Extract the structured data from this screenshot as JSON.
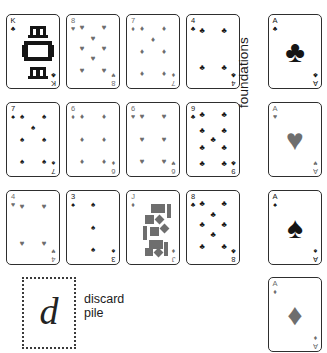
{
  "app": {
    "title": "Solitaire board",
    "background": "#ffffff",
    "black_suit_color": "#151515",
    "red_suit_color": "#6e6e6e"
  },
  "labels": {
    "foundations": "foundations",
    "discard_line1": "discard",
    "discard_line2": "pile",
    "discard_placeholder_glyph": "d"
  },
  "suit_glyphs": {
    "clubs": "♣",
    "hearts": "♥",
    "spades": "♠",
    "diamonds": "♦"
  },
  "tableau": {
    "columns": 4,
    "rows": 3,
    "cards": [
      {
        "rank": "K",
        "suit": "clubs",
        "suit_glyph": "♣",
        "color": "#151515",
        "row": 1,
        "col": 1,
        "face": true
      },
      {
        "rank": "8",
        "suit": "hearts",
        "suit_glyph": "♥",
        "color": "#6e6e6e",
        "row": 1,
        "col": 2,
        "face": false
      },
      {
        "rank": "7",
        "suit": "diamonds",
        "suit_glyph": "♦",
        "color": "#6e6e6e",
        "row": 1,
        "col": 3,
        "face": false
      },
      {
        "rank": "4",
        "suit": "clubs",
        "suit_glyph": "♣",
        "color": "#151515",
        "row": 1,
        "col": 4,
        "face": false
      },
      {
        "rank": "7",
        "suit": "spades",
        "suit_glyph": "♠",
        "color": "#151515",
        "row": 2,
        "col": 1,
        "face": false
      },
      {
        "rank": "6",
        "suit": "diamonds",
        "suit_glyph": "♦",
        "color": "#6e6e6e",
        "row": 2,
        "col": 2,
        "face": false
      },
      {
        "rank": "6",
        "suit": "hearts",
        "suit_glyph": "♥",
        "color": "#6e6e6e",
        "row": 2,
        "col": 3,
        "face": false
      },
      {
        "rank": "9",
        "suit": "clubs",
        "suit_glyph": "♣",
        "color": "#151515",
        "row": 2,
        "col": 4,
        "face": false
      },
      {
        "rank": "4",
        "suit": "hearts",
        "suit_glyph": "♥",
        "color": "#6e6e6e",
        "row": 3,
        "col": 1,
        "face": false
      },
      {
        "rank": "3",
        "suit": "spades",
        "suit_glyph": "♠",
        "color": "#151515",
        "row": 3,
        "col": 2,
        "face": false
      },
      {
        "rank": "J",
        "suit": "diamonds",
        "suit_glyph": "♦",
        "color": "#6e6e6e",
        "row": 3,
        "col": 3,
        "face": true
      },
      {
        "rank": "8",
        "suit": "clubs",
        "suit_glyph": "♣",
        "color": "#151515",
        "row": 3,
        "col": 4,
        "face": false
      }
    ]
  },
  "foundations": {
    "cards": [
      {
        "rank": "A",
        "suit": "clubs",
        "suit_glyph": "♣",
        "color": "#151515",
        "slot": 1
      },
      {
        "rank": "A",
        "suit": "hearts",
        "suit_glyph": "♥",
        "color": "#6e6e6e",
        "slot": 2
      },
      {
        "rank": "A",
        "suit": "spades",
        "suit_glyph": "♠",
        "color": "#151515",
        "slot": 3
      },
      {
        "rank": "A",
        "suit": "diamonds",
        "suit_glyph": "♦",
        "color": "#6e6e6e",
        "slot": 4
      }
    ]
  }
}
